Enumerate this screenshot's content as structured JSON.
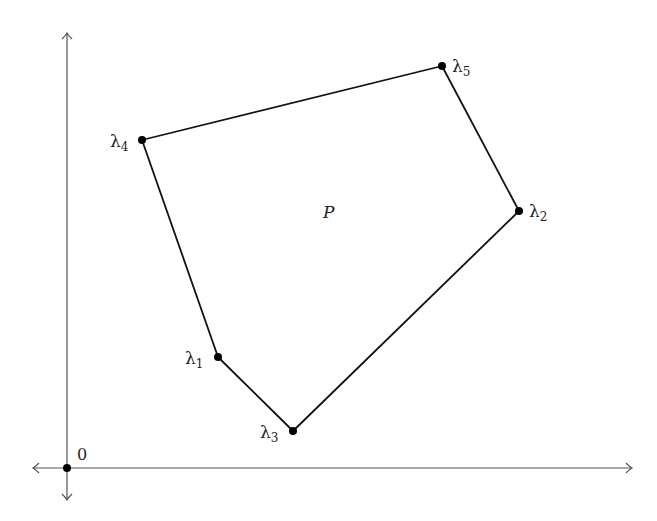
{
  "diagram": {
    "region_label": "P",
    "origin_label": "0",
    "colors": {
      "edge": "#111111",
      "axis": "#555555",
      "vertex": "#000000",
      "text": "#222222",
      "fill": "#ffffff"
    },
    "vertices": [
      {
        "id": "lambda1",
        "symbol": "λ",
        "sub": "1",
        "x": 218,
        "y": 357
      },
      {
        "id": "lambda3",
        "symbol": "λ",
        "sub": "3",
        "x": 293,
        "y": 431
      },
      {
        "id": "lambda2",
        "symbol": "λ",
        "sub": "2",
        "x": 519,
        "y": 211
      },
      {
        "id": "lambda5",
        "symbol": "λ",
        "sub": "5",
        "x": 442,
        "y": 66
      },
      {
        "id": "lambda4",
        "symbol": "λ",
        "sub": "4",
        "x": 142,
        "y": 140
      }
    ],
    "edge_order": [
      "λ1",
      "λ3",
      "λ2",
      "λ5",
      "λ4"
    ],
    "axes": {
      "origin": {
        "x": 67,
        "y": 468
      },
      "x_axis": {
        "from": 33,
        "to": 632
      },
      "y_axis": {
        "from": 500,
        "to": 33
      }
    }
  }
}
